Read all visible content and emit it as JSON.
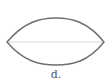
{
  "figure": {
    "label": "d.",
    "shape": "lens",
    "outline_color": "#6e6e6e",
    "midline_color": "#e4e4e4"
  }
}
